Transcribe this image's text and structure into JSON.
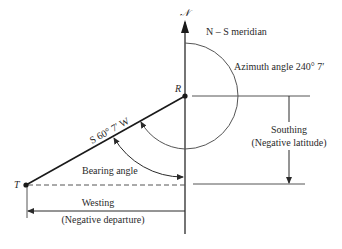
{
  "diagram": {
    "north_symbol": "𝒩",
    "meridian_label": "N – S meridian",
    "azimuth_label": "Azimuth angle 240° 7′",
    "bearing_line_label": "S 60° 7′ W",
    "bearing_angle_label": "Bearing angle",
    "southing_label": "Southing",
    "southing_sublabel": "(Negative latitude)",
    "westing_label": "Westing",
    "westing_sublabel": "(Negative departure)",
    "point_r": "R",
    "point_t": "T"
  },
  "colors": {
    "line": "#2a2a2a",
    "arc": "#555555",
    "background": "#ffffff"
  }
}
